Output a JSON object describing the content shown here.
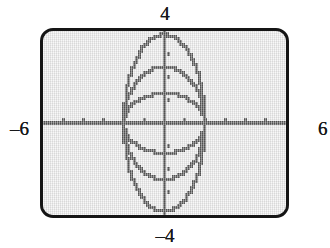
{
  "app": {
    "kind": "graphing-calculator-screen",
    "description": "Graphing calculator viewport showing a family of six ellipse arcs sharing x-intercepts at -2 and 2"
  },
  "labels": {
    "y_max": "4",
    "y_min": "–4",
    "x_min": "–6",
    "x_max": "6"
  },
  "colors": {
    "bezel": "#151515",
    "screen_background": "#e9e9e9",
    "curve": "#000000",
    "axis": "#000000",
    "label_text": "#17181a"
  },
  "chart_data": {
    "type": "line",
    "title": "",
    "xlabel": "",
    "ylabel": "",
    "xlim": [
      -6,
      6
    ],
    "ylim": [
      -4,
      4
    ],
    "xtick_step": 1,
    "ytick_step": 1,
    "grid": false,
    "legend": false,
    "axes": {
      "x_axis_visible": true,
      "y_axis_visible": true,
      "x_ticks": [
        -6,
        -5,
        -4,
        -3,
        -2,
        -1,
        1,
        2,
        3,
        4,
        5,
        6
      ],
      "y_ticks": [
        -4,
        -3,
        -2,
        -1,
        1,
        2,
        3,
        4
      ]
    },
    "shared_x_intercepts": [
      -2,
      2
    ],
    "series": [
      {
        "name": "ellipse-a (b=3.85)",
        "semi_major_x": 2.0,
        "semi_minor_y": 3.85,
        "half": "upper"
      },
      {
        "name": "ellipse-a (b=3.85)",
        "semi_major_x": 2.0,
        "semi_minor_y": 3.85,
        "half": "lower"
      },
      {
        "name": "ellipse-b (b=2.45)",
        "semi_major_x": 2.0,
        "semi_minor_y": 2.45,
        "half": "upper"
      },
      {
        "name": "ellipse-b (b=2.45)",
        "semi_major_x": 2.0,
        "semi_minor_y": 2.45,
        "half": "lower"
      },
      {
        "name": "ellipse-c (b=1.30)",
        "semi_major_x": 2.0,
        "semi_minor_y": 1.3,
        "half": "upper"
      },
      {
        "name": "ellipse-c (b=1.30)",
        "semi_major_x": 2.0,
        "semi_minor_y": 1.3,
        "half": "lower"
      }
    ]
  }
}
